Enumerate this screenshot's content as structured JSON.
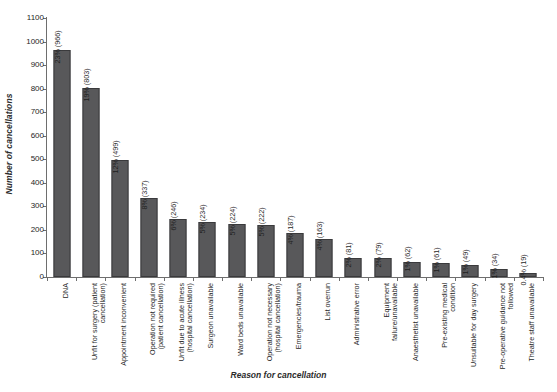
{
  "chart_data": {
    "type": "bar",
    "title": "",
    "xlabel": "Reason for cancellation",
    "ylabel": "Number of cancellations",
    "ylim": [
      0,
      1100
    ],
    "ytick_values": [
      0,
      100,
      200,
      300,
      400,
      500,
      600,
      700,
      800,
      900,
      1000,
      1100
    ],
    "ytick_labels": [
      "0",
      "100",
      "200",
      "300",
      "400",
      "500",
      "600",
      "700",
      "800",
      "900",
      "1000",
      "1100"
    ],
    "grid": false,
    "legend": "none",
    "bar_color": "#58585a",
    "bar_edge_color": "#3a3a3c",
    "axis_color": "#6e6e6e",
    "categories": [
      "DNA",
      "Unfit for surgery (patient cancellation)",
      "Appointment inconvenient",
      "Operation not required (patient cancellation)",
      "Unfit due to acute illness (hospital cancellation)",
      "Surgeon unavailable",
      "Ward beds unavailable",
      "Operation not necessary (hospital cancellation)",
      "Emergencies/trauma",
      "List overrun",
      "Administrative error",
      "Equipment failure/unavailable",
      "Anaesthetist unavailable",
      "Pre-existing medical condition",
      "Unsuitable for day surgery",
      "Pre-operative guidance not followed",
      "Theatre staff unavailable"
    ],
    "category_lines": [
      [
        "DNA"
      ],
      [
        "Unfit for surgery (patient",
        "cancellation)"
      ],
      [
        "Appointment inconvenient"
      ],
      [
        "Operation not required",
        "(patient cancellation)"
      ],
      [
        "Unfit due to acute illness",
        "(hospital cancellation)"
      ],
      [
        "Surgeon unavailable"
      ],
      [
        "Ward beds unavailable"
      ],
      [
        "Operation not necessary",
        "(hospital cancellation)"
      ],
      [
        "Emergencies/trauma"
      ],
      [
        "List overrun"
      ],
      [
        "Administrative error"
      ],
      [
        "Equipment",
        "failure/unavailable"
      ],
      [
        "Anaesthetist unavailable"
      ],
      [
        "Pre-existing medical",
        "condition"
      ],
      [
        "Unsuitable for day surgery"
      ],
      [
        "Pre-operative guidance not",
        "followed"
      ],
      [
        "Theatre staff unavailable"
      ]
    ],
    "values": [
      966,
      803,
      499,
      337,
      246,
      234,
      224,
      222,
      187,
      163,
      81,
      79,
      62,
      61,
      49,
      34,
      19
    ],
    "percents": [
      "23%",
      "19%",
      "12%",
      "8%",
      "6%",
      "5%",
      "5%",
      "5%",
      "4%",
      "4%",
      "2%",
      "2%",
      "1%",
      "1%",
      "1%",
      "1%",
      "0.4%"
    ],
    "data_labels": [
      "23% (966)",
      "19% (803)",
      "12% (499)",
      "8% (337)",
      "6% (246)",
      "5% (234)",
      "5% (224)",
      "5% (222)",
      "4% (187)",
      "4% (163)",
      "2% (81)",
      "2% (79)",
      "1% (62)",
      "1% (61)",
      "1% (49)",
      "1% (34)",
      "0.4% (19)"
    ]
  }
}
